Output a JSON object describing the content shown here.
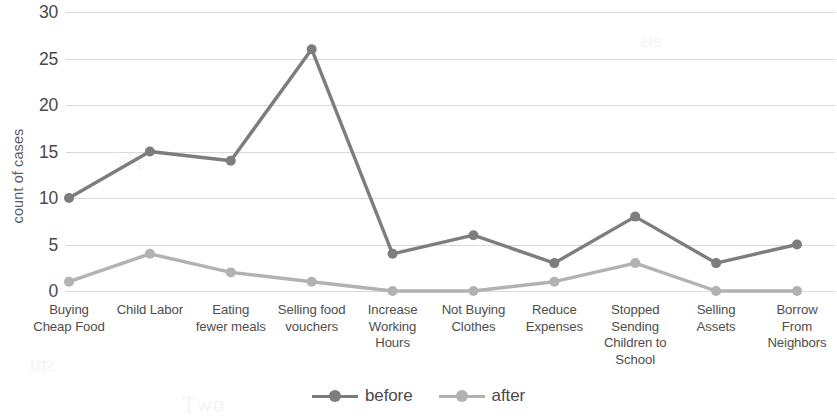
{
  "chart_data": {
    "type": "line",
    "title": "",
    "xlabel": "",
    "ylabel": "count of cases",
    "ylim": [
      0,
      30
    ],
    "ytick_step": 5,
    "yticks": [
      30,
      25,
      20,
      15,
      10,
      5,
      0
    ],
    "grid": true,
    "legend_position": "bottom-center",
    "categories": [
      "Buying Cheap Food",
      "Child Labor",
      "Eating fewer meals",
      "Selling food vouchers",
      "Increase Working Hours",
      "Not Buying Clothes",
      "Reduce Expenses",
      "Stopped Sending Children to School",
      "Selling Assets",
      "Borrow From Neighbors"
    ],
    "category_lines": [
      [
        "Buying",
        "Cheap Food"
      ],
      [
        "Child Labor"
      ],
      [
        "Eating",
        "fewer meals"
      ],
      [
        "Selling food",
        "vouchers"
      ],
      [
        "Increase",
        "Working",
        "Hours"
      ],
      [
        "Not Buying",
        "Clothes"
      ],
      [
        "Reduce",
        "Expenses"
      ],
      [
        "Stopped",
        "Sending",
        "Children to",
        "School"
      ],
      [
        "Selling",
        "Assets"
      ],
      [
        "Borrow",
        "From",
        "Neighbors"
      ]
    ],
    "series": [
      {
        "name": "before",
        "color": "#7d7d7d",
        "values": [
          10,
          15,
          14,
          26,
          4,
          6,
          3,
          8,
          3,
          5
        ]
      },
      {
        "name": "after",
        "color": "#b2b2b2",
        "values": [
          1,
          4,
          2,
          1,
          0,
          0,
          1,
          3,
          0,
          0
        ]
      }
    ]
  },
  "legend": {
    "entries": [
      {
        "label": "before",
        "color": "#7d7d7d"
      },
      {
        "label": "after",
        "color": "#b2b2b2"
      }
    ]
  },
  "artifacts": {
    "items": [
      "stu",
      "owT",
      "ets",
      "pln"
    ]
  }
}
